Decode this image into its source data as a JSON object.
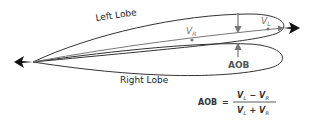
{
  "diagram": {
    "labels": {
      "left_lobe": "Left Lobe",
      "right_lobe": "Right Lobe",
      "v_r": "V",
      "v_r_sub": "R",
      "v_l": "V",
      "v_l_sub": "L",
      "aob": "AOB"
    },
    "formula": {
      "lhs": "AOB",
      "equals": "=",
      "num_a": "V",
      "num_a_sub": "L",
      "num_op": "−",
      "num_b": "V",
      "num_b_sub": "R",
      "den_a": "V",
      "den_a_sub": "L",
      "den_op": "+",
      "den_b": "V",
      "den_b_sub": "R"
    },
    "colors": {
      "line": "#333333",
      "accent_gray": "#777777",
      "aircraft": "#111111"
    }
  }
}
